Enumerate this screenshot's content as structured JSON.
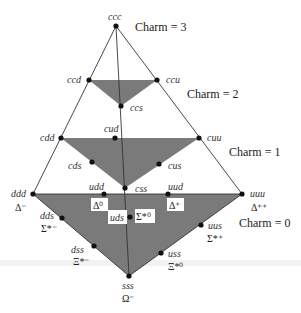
{
  "diagram": {
    "charm_labels": [
      "Charm = 3",
      "Charm = 2",
      "Charm = 1",
      "Charm = 0"
    ],
    "nodes": {
      "ccc": {
        "label": "ccc"
      },
      "ccd": {
        "label": "ccd"
      },
      "ccu": {
        "label": "ccu"
      },
      "ccs": {
        "label": "ccs"
      },
      "cdd": {
        "label": "cdd"
      },
      "cud": {
        "label": "cud"
      },
      "cuu": {
        "label": "cuu"
      },
      "cds": {
        "label": "cds"
      },
      "cus": {
        "label": "cus"
      },
      "css": {
        "label": "css"
      },
      "ddd": {
        "label": "ddd",
        "particle": "Δ⁻"
      },
      "udd": {
        "label": "udd",
        "particle": "Δ⁰"
      },
      "uud": {
        "label": "uud",
        "particle": "Δ⁺"
      },
      "uuu": {
        "label": "uuu",
        "particle": "Δ⁺⁺"
      },
      "dds": {
        "label": "dds",
        "particle": "Σ*⁻"
      },
      "uds": {
        "label": "uds",
        "particle": "Σ*⁰"
      },
      "uus": {
        "label": "uus",
        "particle": "Σ*⁺"
      },
      "dss": {
        "label": "dss",
        "particle": "Ξ*⁻"
      },
      "uss": {
        "label": "uss",
        "particle": "Ξ*⁰"
      },
      "sss": {
        "label": "sss",
        "particle": "Ω⁻"
      }
    },
    "colors": {
      "plane_fill": "#7a7a7a",
      "edge": "#333333",
      "node": "#111111"
    }
  }
}
